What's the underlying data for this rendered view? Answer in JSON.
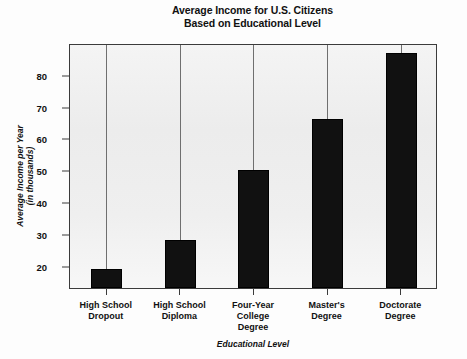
{
  "chart_data": {
    "type": "bar",
    "title": "Average Income for U.S. Citizens Based on Educational Level",
    "title_line1": "Average Income for U.S. Citizens",
    "title_line2": "Based on Educational Level",
    "xlabel": "Educational Level",
    "ylabel": "Average Income per Year (in thousands)",
    "ylabel_line1": "Average Income per Year",
    "ylabel_line2": "(in thousands)",
    "categories": [
      "High School Dropout",
      "High School Diploma",
      "Four-Year College Degree",
      "Master's Degree",
      "Doctorate Degree"
    ],
    "category_lines": [
      [
        "High School",
        "Dropout"
      ],
      [
        "High School",
        "Diploma"
      ],
      [
        "Four-Year",
        "College",
        "Degree"
      ],
      [
        "Master's",
        "Degree"
      ],
      [
        "Doctorate",
        "Degree"
      ]
    ],
    "values": [
      19,
      28,
      50,
      66,
      87
    ],
    "ylim": [
      13,
      90
    ],
    "yticks": [
      20,
      30,
      40,
      50,
      60,
      70,
      80
    ],
    "ytick_labels": [
      "20",
      "30",
      "40",
      "50",
      "60",
      "70",
      "80"
    ],
    "grid": false,
    "legend": null,
    "bar_color": "#111111",
    "plot_bg_color": "#efefef",
    "axis_color": "#3b3b3b",
    "stem_color": "#6f6f6f"
  }
}
